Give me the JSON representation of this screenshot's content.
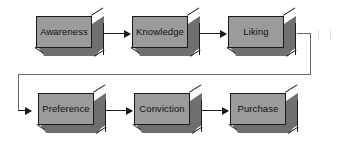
{
  "diagram": {
    "type": "flow-diagram",
    "colors": {
      "box_face": "#9b9b9b",
      "box_shade": "#6f6f6f",
      "outline": "#1a1a1a",
      "connector": "#6a6a6a",
      "background": "#ffffff"
    },
    "rows": [
      {
        "id": "row-top",
        "nodes": [
          {
            "id": "node-awareness",
            "label": "Awareness",
            "x": 36,
            "y": 16
          },
          {
            "id": "node-knowledge",
            "label": "Knowledge",
            "x": 132,
            "y": 16
          },
          {
            "id": "node-liking",
            "label": "Liking",
            "x": 228,
            "y": 16
          }
        ]
      },
      {
        "id": "row-bottom",
        "nodes": [
          {
            "id": "node-preference",
            "label": "Preference",
            "x": 38,
            "y": 93
          },
          {
            "id": "node-conviction",
            "label": "Conviction",
            "x": 134,
            "y": 93
          },
          {
            "id": "node-purchase",
            "label": "Purchase",
            "x": 230,
            "y": 93
          }
        ]
      }
    ],
    "arrows": [
      {
        "id": "arrow-awareness-knowledge",
        "from": "Awareness",
        "to": "Knowledge",
        "x": 104,
        "y": 33,
        "w": 26
      },
      {
        "id": "arrow-knowledge-liking",
        "from": "Knowledge",
        "to": "Liking",
        "x": 200,
        "y": 33,
        "w": 26
      },
      {
        "id": "arrow-preference-conviction",
        "from": "Preference",
        "to": "Conviction",
        "x": 106,
        "y": 110,
        "w": 26
      },
      {
        "id": "arrow-conviction-purchase",
        "from": "Conviction",
        "to": "Purchase",
        "x": 202,
        "y": 110,
        "w": 26
      }
    ],
    "wrap_connector": {
      "id": "connector-liking-preference",
      "from": "Liking",
      "to": "Preference",
      "segments": [
        {
          "kind": "h",
          "x": 297,
          "y": 33,
          "len": 14
        },
        {
          "kind": "v",
          "x": 310,
          "y": 33,
          "len": 41
        },
        {
          "kind": "h",
          "x": 18,
          "y": 74,
          "len": 293
        },
        {
          "kind": "v",
          "x": 18,
          "y": 74,
          "len": 36
        },
        {
          "kind": "arrow",
          "x": 18,
          "y": 110,
          "len": 18
        }
      ]
    }
  }
}
